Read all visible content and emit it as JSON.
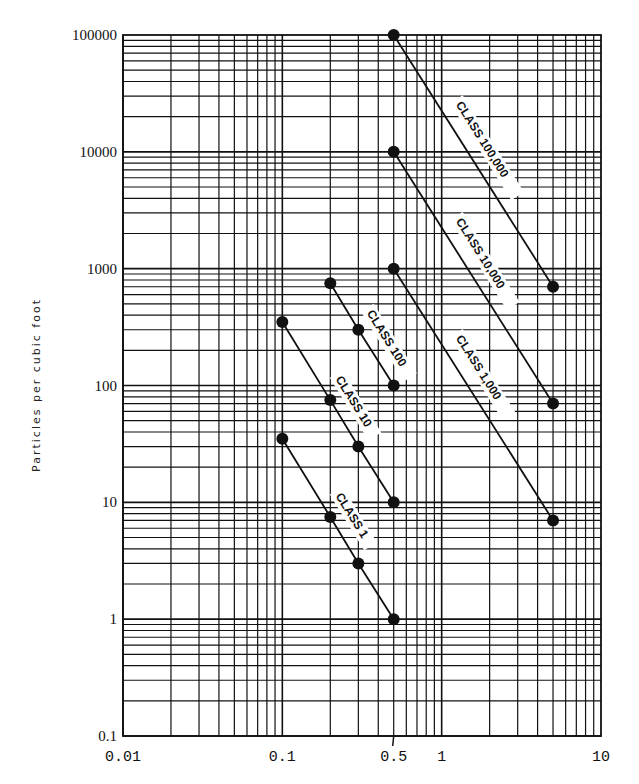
{
  "chart_data": {
    "type": "line",
    "title": "",
    "xlabel": "",
    "ylabel": "Particles per cubic foot",
    "xscale": "log",
    "yscale": "log",
    "xlim": [
      0.01,
      10
    ],
    "ylim": [
      0.1,
      100000
    ],
    "grid": true,
    "legend": "inline labels along lines",
    "x_tick_labels": [
      "0.01",
      "0.1",
      "0.5",
      "1",
      "10"
    ],
    "y_tick_labels": [
      "100000",
      "10000",
      "1000",
      "100",
      "10",
      "1",
      "0.1"
    ],
    "series": [
      {
        "name": "CLASS 100,000",
        "x": [
          0.5,
          5.0
        ],
        "y": [
          100000,
          700
        ]
      },
      {
        "name": "CLASS 10,000",
        "x": [
          0.5,
          5.0
        ],
        "y": [
          10000,
          70
        ]
      },
      {
        "name": "CLASS 1,000",
        "x": [
          0.5,
          5.0
        ],
        "y": [
          1000,
          7
        ]
      },
      {
        "name": "CLASS 100",
        "x": [
          0.2,
          0.3,
          0.5
        ],
        "y": [
          750,
          300,
          100
        ]
      },
      {
        "name": "CLASS 10",
        "x": [
          0.1,
          0.2,
          0.3,
          0.5
        ],
        "y": [
          350,
          75,
          30,
          10
        ]
      },
      {
        "name": "CLASS 1",
        "x": [
          0.1,
          0.2,
          0.3,
          0.5
        ],
        "y": [
          35,
          7.5,
          3,
          1
        ]
      }
    ]
  },
  "axes": {
    "y_title": "Particles per cubic foot",
    "x_ticks": [
      {
        "value": 0.01,
        "label": "0.01"
      },
      {
        "value": 0.1,
        "label": "0.1"
      },
      {
        "value": 0.5,
        "label": "0.5"
      },
      {
        "value": 1,
        "label": "1"
      },
      {
        "value": 10,
        "label": "10"
      }
    ],
    "y_ticks": [
      {
        "value": 100000,
        "label": "100000"
      },
      {
        "value": 10000,
        "label": "10000"
      },
      {
        "value": 1000,
        "label": "1000"
      },
      {
        "value": 100,
        "label": "100"
      },
      {
        "value": 10,
        "label": "10"
      },
      {
        "value": 1,
        "label": "1"
      },
      {
        "value": 0.1,
        "label": "0.1"
      }
    ]
  },
  "colors": {
    "ink": "#111111",
    "background": "#ffffff"
  }
}
